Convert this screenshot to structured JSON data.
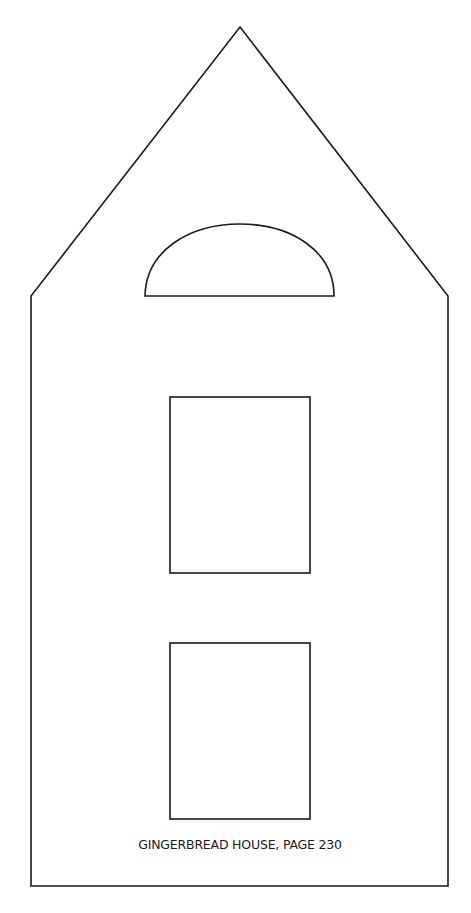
{
  "template": {
    "caption": "GINGERBREAD HOUSE, PAGE 230",
    "stroke_color": "#1a1a1a",
    "background_color": "#ffffff",
    "parts": [
      "house-outline",
      "semicircle-window",
      "upper-window",
      "lower-window"
    ]
  }
}
